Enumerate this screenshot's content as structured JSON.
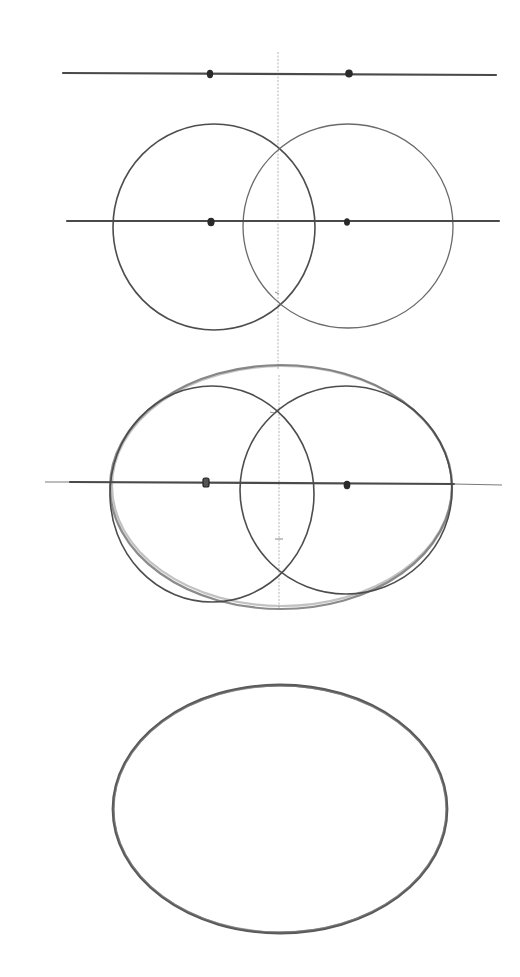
{
  "steps": [
    {
      "step": 1,
      "description": "Horizontal axis line with two focus points marked, vertical centre guide",
      "elements": [
        "horizontal-axis",
        "focus-point-left",
        "focus-point-right",
        "vertical-guide"
      ]
    },
    {
      "step": 2,
      "description": "Two overlapping circles drawn around each focus point on the axis",
      "elements": [
        "horizontal-axis",
        "circle-left",
        "circle-right",
        "focus-point-left",
        "focus-point-right"
      ]
    },
    {
      "step": 3,
      "description": "Outer oval sketched enclosing both circles",
      "elements": [
        "horizontal-axis",
        "circle-left",
        "circle-right",
        "outer-oval",
        "focus-point-left",
        "focus-point-right"
      ]
    },
    {
      "step": 4,
      "description": "Finished oval with construction lines removed",
      "elements": [
        "final-oval"
      ]
    }
  ],
  "colors": {
    "background": "#ffffff",
    "pencil_dark": "#2a2a2a",
    "pencil_mid": "#4d4d4d",
    "pencil_light": "#8a8a8a"
  }
}
